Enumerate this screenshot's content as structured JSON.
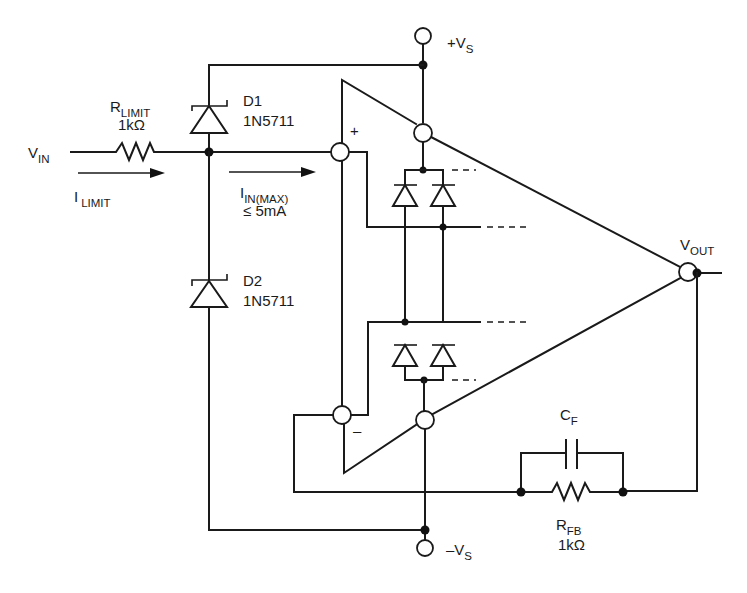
{
  "diagram": {
    "type": "op-amp input protection circuit",
    "supply": {
      "positive": {
        "main": "+V",
        "sub": "S"
      },
      "negative": {
        "main": "–V",
        "sub": "S"
      }
    },
    "input": {
      "vin": {
        "main": "V",
        "sub": "IN"
      },
      "ilimit": {
        "main": "I",
        "sub": "LIMIT"
      },
      "iin_max": {
        "main": "I",
        "sub": "IN(MAX)",
        "limit": "≤ 5mA"
      }
    },
    "resistor_limit": {
      "main": "R",
      "sub": "LIMIT",
      "value": "1kΩ"
    },
    "diode1": {
      "name": "D1",
      "part": "1N5711"
    },
    "diode2": {
      "name": "D2",
      "part": "1N5711"
    },
    "opamp": {
      "plus": "+",
      "minus": "–"
    },
    "output": {
      "main": "V",
      "sub": "OUT"
    },
    "feedback_cap": {
      "main": "C",
      "sub": "F"
    },
    "feedback_res": {
      "main": "R",
      "sub": "FB",
      "value": "1kΩ"
    }
  }
}
